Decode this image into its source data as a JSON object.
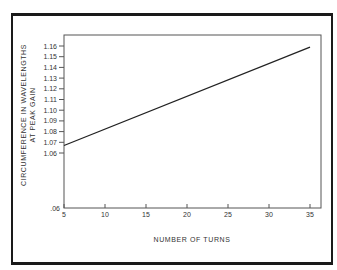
{
  "chart_data": {
    "type": "line",
    "title": "",
    "xlabel": "NUMBER OF TURNS",
    "ylabel_lines": [
      "CIRCUMFERENCE IN WAVELENGTHS",
      "AT PEAK GAIN"
    ],
    "ylabel": "CIRCUMFERENCE IN WAVELENGTHS AT PEAK GAIN",
    "x_ticks": [
      "5",
      "10",
      "15",
      "20",
      "25",
      "30",
      "35"
    ],
    "x_tick_values": [
      5,
      10,
      15,
      20,
      25,
      30,
      35
    ],
    "y_ticks": [
      "1.16",
      "1.15",
      "1.14",
      "1.13",
      "1.12",
      "1.11",
      "1.10",
      "1.09",
      "1.08",
      "1.07",
      "1.06"
    ],
    "y_tick_values": [
      1.16,
      1.15,
      1.14,
      1.13,
      1.12,
      1.11,
      1.1,
      1.09,
      1.08,
      1.07,
      1.06
    ],
    "y_axis_bottom_label": ".06",
    "xlim": [
      5,
      36
    ],
    "ylim_note": "broken axis: 1.06–1.165 scale, bottom labeled .06",
    "grid": false,
    "legend": null,
    "series": [
      {
        "name": "circumference",
        "x": [
          5,
          35
        ],
        "y": [
          1.067,
          1.159
        ]
      }
    ]
  }
}
